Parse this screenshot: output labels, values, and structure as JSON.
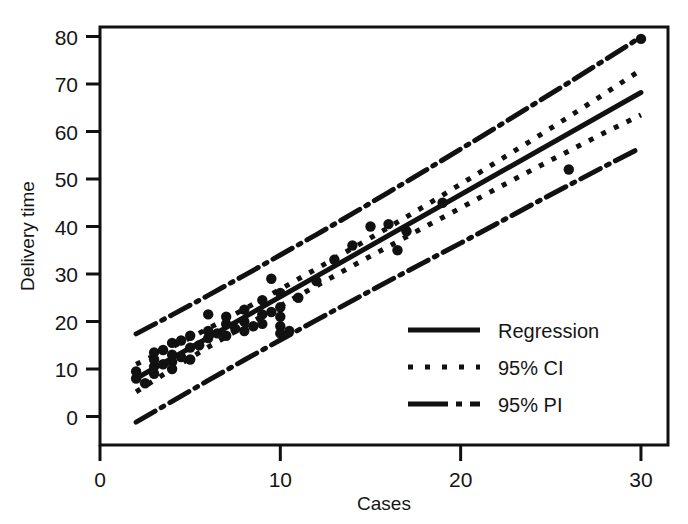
{
  "chart_data": {
    "type": "scatter",
    "title": "",
    "xlabel": "Cases",
    "ylabel": "Delivery time",
    "xlim": [
      0,
      31.5
    ],
    "ylim": [
      -6,
      82
    ],
    "xticks": [
      0,
      10,
      20,
      30
    ],
    "yticks": [
      0,
      10,
      20,
      30,
      40,
      50,
      60,
      70,
      80
    ],
    "xtick_labels": [
      "0",
      "10",
      "20",
      "30"
    ],
    "ytick_labels": [
      "0",
      "10",
      "20",
      "30",
      "40",
      "50",
      "60",
      "70",
      "80"
    ],
    "grid": false,
    "frame": true,
    "legend_position": "lower right",
    "legend": [
      {
        "label": "Regression",
        "style": "solid"
      },
      {
        "label": "95% CI",
        "style": "dotted"
      },
      {
        "label": "95% PI",
        "style": "dashdot"
      }
    ],
    "fit": {
      "intercept": 3.7,
      "slope": 2.15,
      "x_start": 2,
      "x_end": 30,
      "y_start": 8.0,
      "y_end": 68.2
    },
    "ci_band": {
      "x": [
        2,
        4,
        6,
        8,
        10,
        12,
        14,
        16,
        18,
        20,
        22,
        24,
        26,
        28,
        30
      ],
      "upper": [
        11.0,
        14.6,
        18.5,
        22.6,
        26.8,
        31.1,
        35.4,
        39.8,
        44.3,
        48.9,
        53.6,
        58.3,
        63.1,
        68.0,
        73.0
      ],
      "lower": [
        5.2,
        10.0,
        14.6,
        19.0,
        23.3,
        27.5,
        31.7,
        35.8,
        39.9,
        43.9,
        48.0,
        52.0,
        55.9,
        59.8,
        63.5
      ]
    },
    "pi_band": {
      "x": [
        2,
        4,
        6,
        8,
        10,
        12,
        14,
        16,
        18,
        20,
        22,
        24,
        26,
        28,
        30
      ],
      "upper": [
        17.4,
        21.4,
        25.5,
        29.7,
        34.0,
        38.3,
        42.7,
        47.2,
        51.7,
        56.3,
        60.9,
        65.6,
        70.3,
        75.1,
        79.9
      ],
      "lower": [
        -1.2,
        3.2,
        7.6,
        11.9,
        16.1,
        20.3,
        24.4,
        28.5,
        32.5,
        36.5,
        40.6,
        44.7,
        48.7,
        52.7,
        56.6
      ]
    },
    "points": [
      {
        "x": 2,
        "y": 8.0
      },
      {
        "x": 2,
        "y": 9.5
      },
      {
        "x": 2.5,
        "y": 7.0
      },
      {
        "x": 3,
        "y": 10.5
      },
      {
        "x": 3,
        "y": 12.0
      },
      {
        "x": 3,
        "y": 13.5
      },
      {
        "x": 3,
        "y": 9.0
      },
      {
        "x": 3.5,
        "y": 11.0
      },
      {
        "x": 3.5,
        "y": 14.0
      },
      {
        "x": 4,
        "y": 11.5
      },
      {
        "x": 4,
        "y": 13.0
      },
      {
        "x": 4,
        "y": 15.5
      },
      {
        "x": 4,
        "y": 10.0
      },
      {
        "x": 4.5,
        "y": 12.5
      },
      {
        "x": 4.5,
        "y": 16.0
      },
      {
        "x": 5,
        "y": 14.5
      },
      {
        "x": 5,
        "y": 12.0
      },
      {
        "x": 5,
        "y": 17.0
      },
      {
        "x": 5.5,
        "y": 15.0
      },
      {
        "x": 6,
        "y": 21.5
      },
      {
        "x": 6,
        "y": 16.5
      },
      {
        "x": 6,
        "y": 18.0
      },
      {
        "x": 6.5,
        "y": 17.5
      },
      {
        "x": 7,
        "y": 19.5
      },
      {
        "x": 7,
        "y": 17.0
      },
      {
        "x": 7,
        "y": 21.0
      },
      {
        "x": 7.5,
        "y": 18.5
      },
      {
        "x": 8,
        "y": 20.0
      },
      {
        "x": 8,
        "y": 22.5
      },
      {
        "x": 8,
        "y": 18.0
      },
      {
        "x": 8.5,
        "y": 19.0
      },
      {
        "x": 9,
        "y": 24.5
      },
      {
        "x": 9,
        "y": 21.5
      },
      {
        "x": 9,
        "y": 19.5
      },
      {
        "x": 9.5,
        "y": 29.0
      },
      {
        "x": 9.5,
        "y": 22.0
      },
      {
        "x": 10,
        "y": 26.0
      },
      {
        "x": 10,
        "y": 23.0
      },
      {
        "x": 10,
        "y": 21.0
      },
      {
        "x": 10,
        "y": 19.0
      },
      {
        "x": 10,
        "y": 17.5
      },
      {
        "x": 10.5,
        "y": 18.0
      },
      {
        "x": 11,
        "y": 25.0
      },
      {
        "x": 12,
        "y": 28.5
      },
      {
        "x": 13,
        "y": 33.0
      },
      {
        "x": 14,
        "y": 36.0
      },
      {
        "x": 15,
        "y": 40.0
      },
      {
        "x": 16,
        "y": 40.5
      },
      {
        "x": 16.5,
        "y": 35.0
      },
      {
        "x": 17,
        "y": 39.0
      },
      {
        "x": 19,
        "y": 45.0
      },
      {
        "x": 26,
        "y": 52.0
      },
      {
        "x": 30,
        "y": 79.5
      }
    ]
  },
  "axes": {
    "y_title": "Delivery time",
    "x_title": "Cases"
  },
  "colors": {
    "ink": "#111111",
    "background": "#ffffff"
  }
}
